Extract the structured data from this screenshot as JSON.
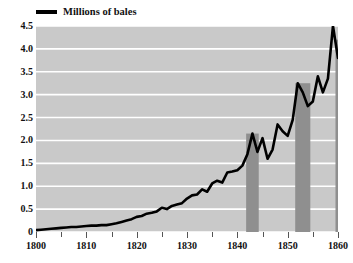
{
  "chart_data": {
    "type": "line",
    "title": "",
    "subtitle": "",
    "xlabel": "",
    "ylabel": "",
    "xlim": [
      1800,
      1860
    ],
    "ylim": [
      0,
      4.5
    ],
    "grid": "horizontal",
    "legend_position": "top-left",
    "legend": [
      {
        "name": "Millions of bales",
        "color": "#000000",
        "marker": "line"
      }
    ],
    "y_ticks": [
      "0",
      "0.5",
      "1.0",
      "1.5",
      "2.0",
      "2.5",
      "3.0",
      "3.5",
      "4.0",
      "4.5"
    ],
    "y_tick_values": [
      0,
      0.5,
      1.0,
      1.5,
      2.0,
      2.5,
      3.0,
      3.5,
      4.0,
      4.5
    ],
    "x_ticks": [
      "1800",
      "1810",
      "1820",
      "1830",
      "1840",
      "1850",
      "1860"
    ],
    "x_tick_values": [
      1800,
      1810,
      1820,
      1830,
      1840,
      1850,
      1860
    ],
    "x_minor_tick_values": [
      1805,
      1815,
      1825,
      1835,
      1845,
      1855
    ],
    "series": [
      {
        "name": "Millions of bales",
        "color": "#000000",
        "x": [
          1800,
          1801,
          1802,
          1803,
          1804,
          1805,
          1806,
          1807,
          1808,
          1809,
          1810,
          1811,
          1812,
          1813,
          1814,
          1815,
          1816,
          1817,
          1818,
          1819,
          1820,
          1821,
          1822,
          1823,
          1824,
          1825,
          1826,
          1827,
          1828,
          1829,
          1830,
          1831,
          1832,
          1833,
          1834,
          1835,
          1836,
          1837,
          1838,
          1839,
          1840,
          1841,
          1842,
          1843,
          1844,
          1845,
          1846,
          1847,
          1848,
          1849,
          1850,
          1851,
          1852,
          1853,
          1854,
          1855,
          1856,
          1857,
          1858,
          1859,
          1860
        ],
        "values": [
          0.04,
          0.05,
          0.06,
          0.07,
          0.08,
          0.09,
          0.1,
          0.11,
          0.11,
          0.12,
          0.13,
          0.14,
          0.14,
          0.15,
          0.15,
          0.17,
          0.19,
          0.22,
          0.25,
          0.28,
          0.33,
          0.35,
          0.4,
          0.42,
          0.45,
          0.53,
          0.5,
          0.57,
          0.6,
          0.63,
          0.73,
          0.8,
          0.82,
          0.93,
          0.88,
          1.06,
          1.12,
          1.08,
          1.3,
          1.32,
          1.35,
          1.45,
          1.7,
          2.15,
          1.75,
          2.05,
          1.6,
          1.8,
          2.35,
          2.2,
          2.1,
          2.45,
          3.25,
          3.05,
          2.75,
          2.85,
          3.4,
          3.05,
          3.35,
          4.5,
          3.8
        ]
      }
    ],
    "highlight_bars": {
      "color": "#8f8f8f",
      "items": [
        {
          "year": 1843,
          "value": 2.15,
          "width_years": 2.5
        },
        {
          "year": 1853,
          "value": 3.25,
          "width_years": 3.0
        },
        {
          "year": 1860,
          "value": 4.2,
          "width_years": 1.0
        }
      ]
    }
  },
  "chart": {
    "title": "",
    "legend_label": "Millions of bales",
    "colors": {
      "plot_background": "#c9c9c9",
      "gridline": "#ffffff",
      "line": "#000000",
      "bar": "#8f8f8f",
      "text": "#111111",
      "page_background": "#ffffff"
    }
  }
}
